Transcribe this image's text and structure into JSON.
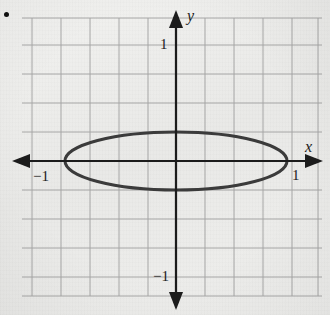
{
  "figure": {
    "bullet_marker": "•",
    "background_color": "#eeeeec",
    "grid_color": "#9a9a9a",
    "axis_color": "#1b1b1b",
    "curve_color": "#3a3a3a"
  },
  "labels": {
    "x_axis": "x",
    "y_axis": "y",
    "x_positive_tick": "1",
    "x_negative_tick": "−1",
    "y_positive_tick": "1",
    "y_negative_tick": "−1"
  },
  "chart_data": {
    "type": "line",
    "title": "",
    "subtitle": "",
    "xlabel": "x",
    "ylabel": "y",
    "xlim": [
      -1.5,
      1.5
    ],
    "ylim": [
      -1.5,
      1.5
    ],
    "grid": true,
    "grid_spacing": 0.25,
    "legend": false,
    "legend_position": "none",
    "xticks": [
      -1,
      1
    ],
    "xticklabels": [
      "−1",
      "1"
    ],
    "yticks": [
      -1,
      1
    ],
    "yticklabels": [
      "−1",
      "1"
    ],
    "annotations": [],
    "series": [
      {
        "name": "ellipse",
        "shape": "ellipse",
        "center": [
          0,
          0
        ],
        "semi_axis_x": 1,
        "semi_axis_y": 0.25,
        "equation": "x^2 + y^2/0.0625 = 1",
        "x_intercepts": [
          -1,
          1
        ],
        "y_intercepts": [
          -0.25,
          0.25
        ],
        "closed": true,
        "color": "#3a3a3a",
        "linewidth": 3
      }
    ]
  }
}
